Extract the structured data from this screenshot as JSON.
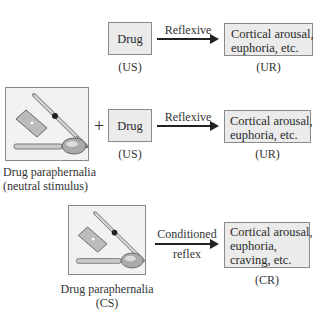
{
  "row1": {
    "stimulus_box": "Drug",
    "stimulus_caption": "(US)",
    "arrow_label": "Reflexive",
    "response_box_lines": [
      "Cortical arousal,",
      "euphoria, etc."
    ],
    "response_caption": "(UR)"
  },
  "row2": {
    "image_icon": "drug-paraphernalia-icon",
    "image_caption_lines": [
      "Drug paraphernalia",
      "(neutral stimulus)"
    ],
    "plus": "+",
    "stimulus_box": "Drug",
    "stimulus_caption": "(US)",
    "arrow_label": "Reflexive",
    "response_box_lines": [
      "Cortical arousal,",
      "euphoria, etc."
    ],
    "response_caption": "(UR)"
  },
  "row3": {
    "image_icon": "drug-paraphernalia-icon",
    "image_caption_lines": [
      "Drug paraphernalia",
      "(CS)"
    ],
    "arrow_label_lines": [
      "Conditioned",
      "reflex"
    ],
    "response_box_lines": [
      "Cortical arousal,",
      "euphoria,",
      "craving, etc."
    ],
    "response_caption": "(CR)"
  },
  "colors": {
    "box_fill": "#ebebeb",
    "box_border": "#8a8a8a",
    "arrow": "#222222"
  }
}
